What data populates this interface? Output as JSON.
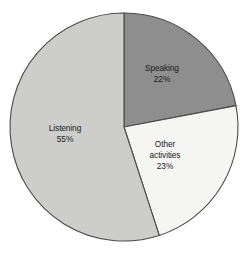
{
  "chart_data": {
    "type": "pie",
    "title": "",
    "subtitle": "",
    "xlabel": "",
    "ylabel": "",
    "legend_position": "none",
    "grid": false,
    "labels_inside_slices": true,
    "start_angle_deg": 0,
    "direction": "clockwise",
    "categories": [
      "Speaking",
      "Other activities",
      "Listening"
    ],
    "values": [
      22,
      23,
      55
    ],
    "value_unit": "%",
    "slices": [
      {
        "name": "Speaking",
        "label_line1": "Speaking",
        "label_line2": "22%",
        "value": 22,
        "display_value": "22%",
        "angle_deg": 79.2,
        "color": "#8e8e8e"
      },
      {
        "name": "Other activities",
        "label_line1": "Other",
        "label_line2": "activities",
        "label_line3": "23%",
        "value": 23,
        "display_value": "23%",
        "angle_deg": 82.8,
        "color": "#f5f5f3"
      },
      {
        "name": "Listening",
        "label_line1": "Listening",
        "label_line2": "55%",
        "value": 55,
        "display_value": "55%",
        "angle_deg": 198.0,
        "color": "#cdcdcb"
      }
    ],
    "colors": {
      "speaking": "#8e8e8e",
      "other_activities": "#f5f5f3",
      "listening": "#cdcdcb",
      "outline": "#4a4a4a",
      "text": "#1b1b1b",
      "background": "#ffffff"
    }
  }
}
